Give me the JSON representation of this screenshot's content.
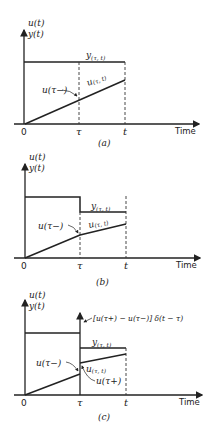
{
  "figure": {
    "panels": [
      {
        "id": "a",
        "caption": "(a)",
        "y_axis_label_1": "u(t)",
        "y_axis_label_2": "y(t)",
        "x_axis_label": "Time",
        "origin_label": "0",
        "tau_label": "τ",
        "t_label": "t",
        "y_curve_label": "y",
        "y_curve_sub": "(τ, t)",
        "u_before_label": "u(τ−)",
        "u_segment_label": "u",
        "u_segment_sub": "(τ, t)"
      },
      {
        "id": "b",
        "caption": "(b)",
        "y_axis_label_1": "u(t)",
        "y_axis_label_2": "y(t)",
        "x_axis_label": "Time",
        "origin_label": "0",
        "tau_label": "τ",
        "t_label": "t",
        "y_curve_label": "y",
        "y_curve_sub": "(τ, t)",
        "u_before_label": "u(τ−)",
        "u_segment_label": "u",
        "u_segment_sub": "(τ, t)"
      },
      {
        "id": "c",
        "caption": "(c)",
        "y_axis_label_1": "u(t)",
        "y_axis_label_2": "y(t)",
        "x_axis_label": "Time",
        "origin_label": "0",
        "tau_label": "τ",
        "t_label": "t",
        "impulse_label": "[u(τ+) − u(τ−)] δ(t − τ)",
        "y_curve_label": "y",
        "y_curve_sub": "(τ, t)",
        "u_before_label": "u(τ−)",
        "u_segment_label": "u",
        "u_segment_sub": "(τ, t)",
        "u_after_label": "u(τ+)"
      }
    ]
  }
}
